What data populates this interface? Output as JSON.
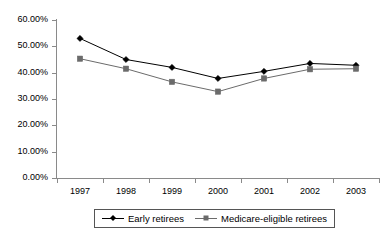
{
  "chart_data": {
    "type": "line",
    "title": "",
    "xlabel": "",
    "ylabel": "",
    "categories": [
      "1997",
      "1998",
      "1999",
      "2000",
      "2001",
      "2002",
      "2003"
    ],
    "ylim": [
      0,
      60
    ],
    "y_tick_values": [
      0,
      10,
      20,
      30,
      40,
      50,
      60
    ],
    "y_tick_labels": [
      "0.00%",
      "10.00%",
      "20.00%",
      "30.00%",
      "40.00%",
      "50.00%",
      "60.00%"
    ],
    "value_suffix": "%",
    "grid": false,
    "legend_position": "bottom",
    "series": [
      {
        "name": "Early retirees",
        "marker": "diamond",
        "color": "#000000",
        "values": [
          53.0,
          45.0,
          42.0,
          37.8,
          40.5,
          43.5,
          42.8
        ]
      },
      {
        "name": "Medicare-eligible retirees",
        "marker": "square",
        "color": "#6b6b6b",
        "values": [
          45.3,
          41.5,
          36.5,
          32.8,
          37.8,
          41.3,
          41.5
        ]
      }
    ]
  },
  "legend": {
    "entries": [
      {
        "label": "Early retirees"
      },
      {
        "label": "Medicare-eligible retirees"
      }
    ]
  },
  "colors": {
    "series_early": "#000000",
    "series_medicare": "#6b6b6b",
    "axis": "#8a8a8a",
    "background": "#ffffff",
    "text": "#000000"
  }
}
